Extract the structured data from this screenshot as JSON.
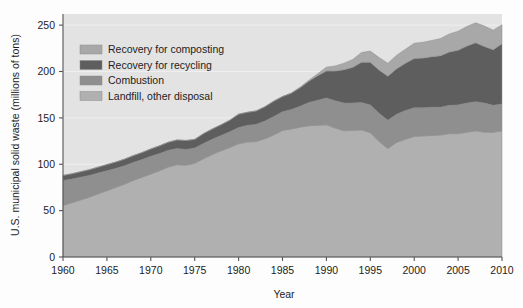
{
  "chart_data": {
    "type": "area",
    "stacked": true,
    "title": "",
    "xlabel": "Year",
    "ylabel": "U.S. municipal solid waste (millions of tons)",
    "xlim": [
      1960,
      2010
    ],
    "ylim": [
      0,
      262
    ],
    "xticks": [
      1960,
      1965,
      1970,
      1975,
      1980,
      1985,
      1990,
      1995,
      2000,
      2005,
      2010
    ],
    "yticks": [
      0,
      50,
      100,
      150,
      200,
      250
    ],
    "grid": "horizontal-faint",
    "legend_position": "upper-left-inside",
    "x": [
      1960,
      1961,
      1962,
      1963,
      1964,
      1965,
      1966,
      1967,
      1968,
      1969,
      1970,
      1971,
      1972,
      1973,
      1974,
      1975,
      1976,
      1977,
      1978,
      1979,
      1980,
      1981,
      1982,
      1983,
      1984,
      1985,
      1986,
      1987,
      1988,
      1989,
      1990,
      1991,
      1992,
      1993,
      1994,
      1995,
      1996,
      1997,
      1998,
      1999,
      2000,
      2001,
      2002,
      2003,
      2004,
      2005,
      2006,
      2007,
      2008,
      2009,
      2010
    ],
    "series": [
      {
        "name": "Landfill, other disposal",
        "color": "#b0b0b0",
        "order": 1,
        "values": [
          55.5,
          58.5,
          61.5,
          64.5,
          68.0,
          71.5,
          75.0,
          78.5,
          82.5,
          86.0,
          89.5,
          93.0,
          97.0,
          99.5,
          99.0,
          101.0,
          106.0,
          110.5,
          114.5,
          118.0,
          122.0,
          124.0,
          124.5,
          127.5,
          131.5,
          136.5,
          138.0,
          140.0,
          141.5,
          142.0,
          142.5,
          139.0,
          136.0,
          136.5,
          137.0,
          134.0,
          124.5,
          117.0,
          123.5,
          127.0,
          130.0,
          130.5,
          131.0,
          131.5,
          133.0,
          133.0,
          134.5,
          136.0,
          134.5,
          134.5,
          136.0
        ]
      },
      {
        "name": "Combustion",
        "color": "#8f8f8f",
        "order": 2,
        "values": [
          27.0,
          25.5,
          24.5,
          23.5,
          22.5,
          21.5,
          20.5,
          20.0,
          19.5,
          19.0,
          19.0,
          18.5,
          18.0,
          17.5,
          17.0,
          16.5,
          16.5,
          16.5,
          16.5,
          17.0,
          17.5,
          18.0,
          18.5,
          19.0,
          20.0,
          20.0,
          21.0,
          22.5,
          25.0,
          27.0,
          29.0,
          29.5,
          30.0,
          29.5,
          29.5,
          30.0,
          30.5,
          30.5,
          30.5,
          31.0,
          31.0,
          30.5,
          30.5,
          30.0,
          30.5,
          31.0,
          31.5,
          31.5,
          31.5,
          29.0,
          29.0
        ]
      },
      {
        "name": "Recovery for recycling",
        "color": "#5e5e5e",
        "order": 3,
        "values": [
          5.5,
          5.7,
          5.9,
          6.1,
          6.4,
          6.6,
          6.8,
          7.0,
          7.3,
          7.6,
          8.0,
          8.4,
          8.8,
          9.2,
          9.6,
          9.3,
          10.5,
          11.0,
          11.5,
          12.5,
          14.5,
          14.0,
          14.5,
          15.5,
          16.5,
          16.5,
          17.5,
          20.0,
          23.0,
          26.5,
          29.0,
          32.0,
          36.0,
          38.5,
          43.5,
          46.0,
          46.5,
          47.5,
          49.0,
          51.0,
          53.0,
          53.5,
          54.5,
          55.5,
          57.5,
          59.0,
          61.5,
          63.5,
          61.0,
          60.0,
          65.0
        ]
      },
      {
        "name": "Recovery for composting",
        "color": "#a8a8a8",
        "order": 4,
        "values": [
          0.0,
          0.0,
          0.0,
          0.0,
          0.0,
          0.0,
          0.0,
          0.0,
          0.0,
          0.0,
          0.0,
          0.0,
          0.0,
          0.0,
          0.0,
          0.0,
          0.0,
          0.0,
          0.0,
          0.0,
          0.0,
          0.0,
          0.0,
          0.0,
          0.0,
          0.0,
          0.3,
          0.6,
          1.0,
          2.0,
          4.2,
          5.5,
          7.0,
          8.5,
          10.5,
          12.0,
          13.5,
          14.0,
          14.5,
          15.0,
          16.5,
          17.0,
          17.5,
          18.5,
          19.5,
          20.5,
          21.0,
          21.5,
          22.0,
          21.0,
          20.5
        ]
      }
    ],
    "legend": [
      {
        "label": "Recovery for composting",
        "color": "#a8a8a8"
      },
      {
        "label": "Recovery for recycling",
        "color": "#5e5e5e"
      },
      {
        "label": "Combustion",
        "color": "#8f8f8f"
      },
      {
        "label": "Landfill, other disposal",
        "color": "#b0b0b0"
      }
    ]
  },
  "colors": {
    "plot_background": "#e3e3e3",
    "figure_background": "#fdfdfd",
    "axis": "#555555",
    "text": "#1c1c1c"
  }
}
